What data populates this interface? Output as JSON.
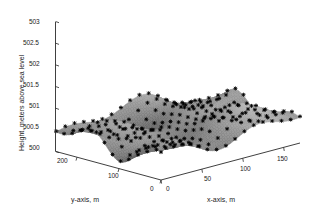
{
  "figure": {
    "background_color": "#ffffff",
    "axis_color": "#2a2a2a",
    "text_color": "#1a1a1a",
    "width": 316,
    "height": 219
  },
  "chart_data": {
    "type": "surface3d",
    "title": "",
    "xlabel": "x-axis, m",
    "ylabel": "y-axis, m",
    "zlabel": "Height, meters above sea level",
    "xticks": [
      "0",
      "50",
      "100",
      "150"
    ],
    "xtick_values": [
      0,
      50,
      100,
      150
    ],
    "yticks": [
      "0",
      "100",
      "200"
    ],
    "ytick_values": [
      0,
      100,
      200
    ],
    "zticks": [
      "500",
      "500.5",
      "501",
      "501.5",
      "502",
      "502.5",
      "503"
    ],
    "ztick_values": [
      500,
      500.5,
      501,
      501.5,
      502,
      502.5,
      503
    ],
    "xlim": [
      0,
      170
    ],
    "ylim": [
      0,
      250
    ],
    "zlim": [
      500,
      503
    ],
    "grid": false,
    "legend": null,
    "colormap": "gray",
    "marker": "plus",
    "marker_color": "#000000",
    "marker_count": 160,
    "surface_description": "Periodic sinusoidal terrain with diagonal wave ridges, heights between 500.0 and 501.3 m, shaded grayscale mesh with scattered plus-sign data markers",
    "z_range_observed": [
      500.0,
      501.3
    ],
    "view_azimuth": -37.5,
    "view_elevation": 30
  },
  "zaxis": {
    "labels": [
      "503",
      "502.5",
      "502",
      "501.5",
      "501",
      "500.5",
      "500"
    ]
  },
  "xaxis": {
    "labels": [
      "0",
      "50",
      "100",
      "150"
    ],
    "title": "x-axis, m"
  },
  "yaxis": {
    "labels": [
      "200",
      "100",
      "0"
    ],
    "title": "y-axis, m"
  }
}
